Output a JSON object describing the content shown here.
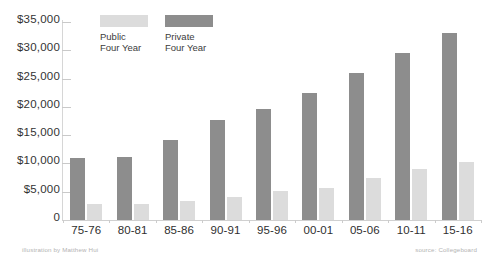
{
  "chart_data": {
    "type": "bar",
    "title": "",
    "subtitle": "",
    "xlabel": "",
    "ylabel": "",
    "categories": [
      "75-76",
      "80-81",
      "85-86",
      "90-91",
      "95-96",
      "00-01",
      "05-06",
      "10-11",
      "15-16"
    ],
    "series": [
      {
        "name": "Private Four Year",
        "color": "#8d8d8d",
        "values": [
          10900,
          11200,
          14100,
          17700,
          19600,
          22400,
          26000,
          29600,
          33000
        ]
      },
      {
        "name": "Public Four Year",
        "color": "#dcdcdc",
        "values": [
          2900,
          2900,
          3400,
          4100,
          5100,
          5700,
          7500,
          9100,
          10300
        ]
      }
    ],
    "ylim": [
      0,
      35000
    ],
    "yticks": [
      0,
      5000,
      10000,
      15000,
      20000,
      25000,
      30000,
      35000
    ],
    "ytick_labels": [
      "0",
      "$5,000",
      "$10,000",
      "$15,000",
      "$20,000",
      "$25,000",
      "$30,000",
      "$35,000"
    ],
    "grid": false,
    "legend_position": "top-left-inside"
  },
  "legend": {
    "items": [
      {
        "label_line1": "Public",
        "label_line2": "Four Year",
        "swatch": "public-swatch",
        "color": "#dcdcdc"
      },
      {
        "label_line1": "Private",
        "label_line2": "Four Year",
        "swatch": "private-swatch",
        "color": "#8d8d8d"
      }
    ]
  },
  "credits": {
    "left": "illustration by Matthew Hui",
    "right": "source: Collegeboard"
  }
}
